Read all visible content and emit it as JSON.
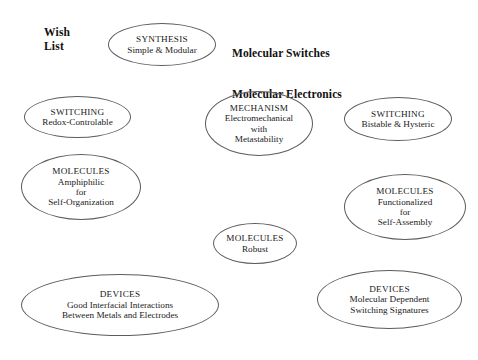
{
  "labels": {
    "wish_list": "Wish\nList",
    "title_line_1": "Molecular Switches",
    "title_line_2": "Molecular Electronics"
  },
  "colors": {
    "background": "#ffffff",
    "ellipse_stroke": "#5c5c5c",
    "text": "#1a1a1a"
  },
  "nodes": [
    {
      "id": "synthesis",
      "head": "SYNTHESIS",
      "lines": [
        "Simple & Modular"
      ],
      "x": 108,
      "y": 23,
      "w": 108,
      "h": 43
    },
    {
      "id": "switching-redox",
      "head": "SWITCHING",
      "lines": [
        "Redox-Controlable"
      ],
      "x": 24,
      "y": 96,
      "w": 107,
      "h": 42
    },
    {
      "id": "mechanism",
      "head": "MECHANISM",
      "lines": [
        "Electromechanical",
        "with",
        "Metastability"
      ],
      "x": 205,
      "y": 91,
      "w": 108,
      "h": 65
    },
    {
      "id": "switching-bistable",
      "head": "SWITCHING",
      "lines": [
        "Bistable & Hysteric"
      ],
      "x": 344,
      "y": 97,
      "w": 108,
      "h": 44
    },
    {
      "id": "molecules-amphiphilic",
      "head": "MOLECULES",
      "lines": [
        "Amphiphilic",
        "for",
        "Self-Organization"
      ],
      "x": 21,
      "y": 154,
      "w": 120,
      "h": 66
    },
    {
      "id": "molecules-functionalized",
      "head": "MOLECULES",
      "lines": [
        "Functionalized",
        "for",
        "Self-Assembly"
      ],
      "x": 344,
      "y": 174,
      "w": 122,
      "h": 66
    },
    {
      "id": "molecules-robust",
      "head": "MOLECULES",
      "lines": [
        "Robust"
      ],
      "x": 213,
      "y": 223,
      "w": 84,
      "h": 41
    },
    {
      "id": "devices-interfacial",
      "head": "DEVICES",
      "lines": [
        "Good Interfacial Interactions",
        "Between Metals and Electrodes"
      ],
      "x": 21,
      "y": 274,
      "w": 198,
      "h": 62
    },
    {
      "id": "devices-signatures",
      "head": "DEVICES",
      "lines": [
        "Molecular Dependent",
        "Switching Signatures"
      ],
      "x": 317,
      "y": 270,
      "w": 145,
      "h": 59
    }
  ]
}
